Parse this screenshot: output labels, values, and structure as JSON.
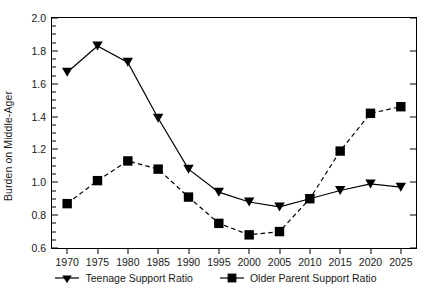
{
  "chart_data": {
    "type": "line",
    "title": "",
    "xlabel": "",
    "ylabel": "Burden on Middle-Ager",
    "x": [
      1970,
      1975,
      1980,
      1985,
      1990,
      1995,
      2000,
      2005,
      2010,
      2015,
      2020,
      2025
    ],
    "categories": [
      "1970",
      "1975",
      "1980",
      "1985",
      "1990",
      "1995",
      "2000",
      "2005",
      "2010",
      "2015",
      "2020",
      "2025"
    ],
    "series": [
      {
        "name": "Teenage Support Ratio",
        "marker": "triangle-down",
        "linestyle": "solid",
        "color": "#000000",
        "values": [
          1.67,
          1.83,
          1.73,
          1.39,
          1.08,
          0.94,
          0.88,
          0.85,
          0.9,
          0.95,
          0.99,
          0.97
        ]
      },
      {
        "name": "Older Parent Support Ratio",
        "marker": "square",
        "linestyle": "dashed",
        "color": "#000000",
        "values": [
          0.87,
          1.01,
          1.13,
          1.08,
          0.91,
          0.75,
          0.68,
          0.7,
          0.9,
          1.19,
          1.42,
          1.46
        ]
      }
    ],
    "ylim": [
      0.6,
      2.0
    ],
    "ytick_labels": [
      "0.6",
      "0.8",
      "1.0",
      "1.2",
      "1.4",
      "1.6",
      "1.8",
      "2.0"
    ],
    "ytick_values": [
      0.6,
      0.8,
      1.0,
      1.2,
      1.4,
      1.6,
      1.8,
      2.0
    ],
    "yminor_step": 0.05,
    "xlim": [
      1967.5,
      2027.5
    ],
    "grid": false,
    "legend_position": "bottom-center"
  },
  "legend": {
    "entries": [
      {
        "label": "Teenage Support Ratio",
        "marker": "triangle-down-icon"
      },
      {
        "label": "Older Parent Support Ratio",
        "marker": "square-icon"
      }
    ]
  }
}
